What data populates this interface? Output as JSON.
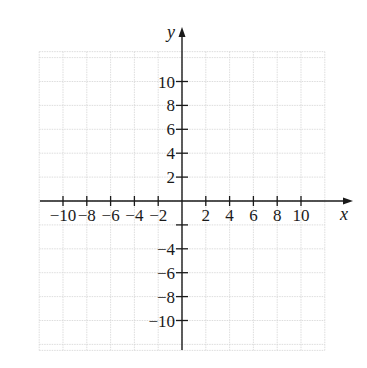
{
  "chart_data": {
    "type": "coordinate-grid",
    "title": "",
    "xlabel": "x",
    "ylabel": "y",
    "xlim": [
      -12,
      12
    ],
    "ylim": [
      -12.5,
      12.5
    ],
    "grid": true,
    "grid_step": 2,
    "x_ticks": [
      -10,
      -8,
      -6,
      -4,
      -2,
      2,
      4,
      6,
      8,
      10
    ],
    "x_tick_labels": [
      "−10",
      "−8",
      "−6",
      "−4",
      "−2",
      "2",
      "4",
      "6",
      "8",
      "10"
    ],
    "y_ticks": [
      10,
      8,
      6,
      4,
      2,
      -2,
      -4,
      -6,
      -8,
      -10
    ],
    "y_tick_labels": [
      "10",
      "8",
      "6",
      "4",
      "2",
      "",
      "−4",
      "−6",
      "−8",
      "−10"
    ],
    "series": []
  },
  "colors": {
    "axis": "#1a1a1a",
    "grid": "#d4d4d4",
    "background": "#ffffff"
  }
}
